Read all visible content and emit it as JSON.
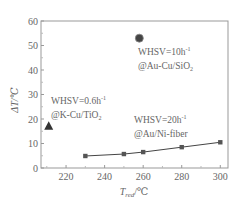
{
  "chart_data": {
    "type": "scatter",
    "title": "",
    "xlabel": "T_red/℃",
    "xlabel_main": "T",
    "xlabel_sub": "red",
    "xlabel_unit": "/℃",
    "ylabel": "ΔT/℃",
    "xlim": [
      207,
      304
    ],
    "ylim": [
      0,
      60
    ],
    "x_ticks": [
      220,
      240,
      260,
      280,
      300
    ],
    "y_ticks": [
      0,
      10,
      20,
      30,
      40,
      50,
      60
    ],
    "grid": false,
    "legend": "none (inline annotations)",
    "series": [
      {
        "name": "WHSV=20h⁻¹ @Au/Ni-fiber",
        "marker": "square",
        "line": true,
        "x": [
          230,
          250,
          260,
          280,
          300
        ],
        "y": [
          4.9,
          5.7,
          6.5,
          8.5,
          10.5
        ]
      },
      {
        "name": "WHSV=10h⁻¹ @Au-Cu/SiO₂",
        "marker": "circle",
        "line": false,
        "x": [
          258
        ],
        "y": [
          53
        ]
      },
      {
        "name": "WHSV=0.6h⁻¹ @K-Cu/TiO₂",
        "marker": "triangle",
        "line": false,
        "x": [
          211
        ],
        "y": [
          17
        ]
      }
    ],
    "annotations": [
      {
        "line1": "WHSV=10h",
        "sup1": "-1",
        "line2": "@Au-Cu/SiO",
        "sub2": "2"
      },
      {
        "line1": "WHSV=0.6h",
        "sup1": "-1",
        "line2": "@K-Cu/TiO",
        "sub2": "2"
      },
      {
        "line1": "WHSV=20h",
        "sup1": "-1",
        "line2": "@Au/Ni-fiber",
        "sub2": ""
      }
    ]
  }
}
